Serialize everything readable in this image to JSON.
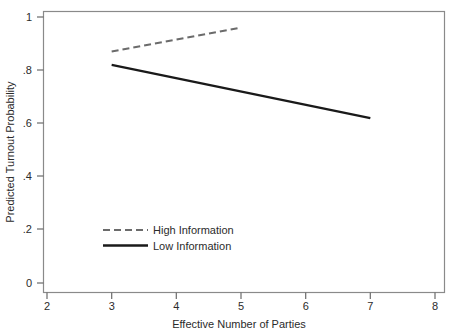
{
  "chart_data": {
    "type": "line",
    "title": "",
    "xlabel": "Effective Number of Parties",
    "ylabel": "Predicted Turnout Probability",
    "xlim": [
      2,
      8
    ],
    "ylim": [
      0,
      1
    ],
    "xticks": [
      "2",
      "3",
      "4",
      "5",
      "6",
      "7",
      "8"
    ],
    "yticks": [
      "0",
      ".2",
      ".4",
      ".6",
      ".8",
      "1"
    ],
    "xtick_values": [
      2,
      3,
      4,
      5,
      6,
      7,
      8
    ],
    "ytick_values": [
      0,
      0.2,
      0.4,
      0.6,
      0.8,
      1
    ],
    "grid": false,
    "legend_position": "inside-lower-left",
    "series": [
      {
        "name": "High Information",
        "style": "dashed",
        "color": "#6b6b6b",
        "x": [
          3,
          5
        ],
        "y": [
          0.87,
          0.96
        ]
      },
      {
        "name": "Low Information",
        "style": "solid",
        "color": "#1a1a1a",
        "x": [
          3,
          7
        ],
        "y": [
          0.82,
          0.62
        ]
      }
    ]
  },
  "axes": {
    "x_title": "Effective Number of Parties",
    "y_title": "Predicted Turnout Probability",
    "x_tick_labels": [
      "2",
      "3",
      "4",
      "5",
      "6",
      "7",
      "8"
    ],
    "y_tick_labels": [
      "0",
      ".2",
      ".4",
      ".6",
      ".8",
      "1"
    ]
  },
  "legend": {
    "entries": [
      {
        "label": "High Information",
        "style": "dashed"
      },
      {
        "label": "Low Information",
        "style": "solid"
      }
    ]
  },
  "colors": {
    "high_information": "#6b6b6b",
    "low_information": "#1a1a1a",
    "frame": "#8a8a8a",
    "text": "#2b2b2b",
    "background": "#ffffff"
  }
}
